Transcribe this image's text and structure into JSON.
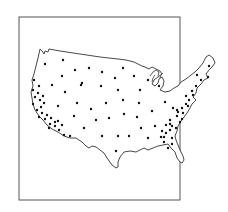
{
  "map": {
    "subject": "Contiguous United States outline with point locations",
    "frame": {
      "x": 19,
      "y": 17,
      "width": 161,
      "height": 183
    },
    "colors": {
      "outline": "#333333",
      "dot": "#111111",
      "frame": "#555555",
      "background": "#ffffff"
    },
    "dot_radius": 1.2,
    "points": [
      [
        45,
        64
      ],
      [
        63,
        60
      ],
      [
        75,
        70
      ],
      [
        89,
        68
      ],
      [
        102,
        72
      ],
      [
        123,
        68
      ],
      [
        134,
        76
      ],
      [
        148,
        80
      ],
      [
        62,
        76
      ],
      [
        82,
        83
      ],
      [
        115,
        78
      ],
      [
        159,
        86
      ],
      [
        34,
        80
      ],
      [
        39,
        86
      ],
      [
        52,
        85
      ],
      [
        101,
        86
      ],
      [
        65,
        92
      ],
      [
        81,
        85
      ],
      [
        118,
        90
      ],
      [
        140,
        90
      ],
      [
        33,
        90
      ],
      [
        38,
        93
      ],
      [
        43,
        96
      ],
      [
        35,
        97
      ],
      [
        40,
        100
      ],
      [
        44,
        103
      ],
      [
        33,
        104
      ],
      [
        41,
        107
      ],
      [
        58,
        106
      ],
      [
        77,
        103
      ],
      [
        91,
        109
      ],
      [
        106,
        103
      ],
      [
        123,
        100
      ],
      [
        139,
        103
      ],
      [
        165,
        102
      ],
      [
        173,
        108
      ],
      [
        37,
        110
      ],
      [
        42,
        113
      ],
      [
        47,
        115
      ],
      [
        39,
        117
      ],
      [
        45,
        119
      ],
      [
        51,
        118
      ],
      [
        50,
        124
      ],
      [
        55,
        122
      ],
      [
        74,
        116
      ],
      [
        96,
        120
      ],
      [
        109,
        118
      ],
      [
        124,
        114
      ],
      [
        137,
        117
      ],
      [
        152,
        111
      ],
      [
        49,
        128
      ],
      [
        55,
        126
      ],
      [
        59,
        130
      ],
      [
        62,
        125
      ],
      [
        58,
        121
      ],
      [
        64,
        135
      ],
      [
        70,
        136
      ],
      [
        84,
        128
      ],
      [
        102,
        136
      ],
      [
        118,
        136
      ],
      [
        129,
        136
      ],
      [
        141,
        128
      ],
      [
        155,
        126
      ],
      [
        148,
        138
      ],
      [
        164,
        142
      ],
      [
        166,
        133
      ],
      [
        170,
        130
      ],
      [
        172,
        138
      ],
      [
        176,
        128
      ],
      [
        164,
        137
      ],
      [
        172,
        126
      ],
      [
        180,
        122
      ],
      [
        177,
        116
      ],
      [
        182,
        119
      ],
      [
        170,
        120
      ],
      [
        166,
        125
      ],
      [
        178,
        112
      ],
      [
        182,
        108
      ],
      [
        186,
        104
      ],
      [
        189,
        100
      ],
      [
        193,
        95
      ],
      [
        177,
        110
      ],
      [
        183,
        113
      ],
      [
        188,
        106
      ],
      [
        172,
        144
      ],
      [
        168,
        148
      ],
      [
        170,
        124
      ],
      [
        186,
        96
      ],
      [
        192,
        91
      ],
      [
        196,
        86
      ],
      [
        201,
        80
      ],
      [
        208,
        77
      ],
      [
        197,
        75
      ],
      [
        209,
        66
      ],
      [
        116,
        151
      ],
      [
        161,
        137
      ],
      [
        162,
        131
      ]
    ],
    "note": "Dot coordinates are approximate pixel positions read from the image"
  }
}
